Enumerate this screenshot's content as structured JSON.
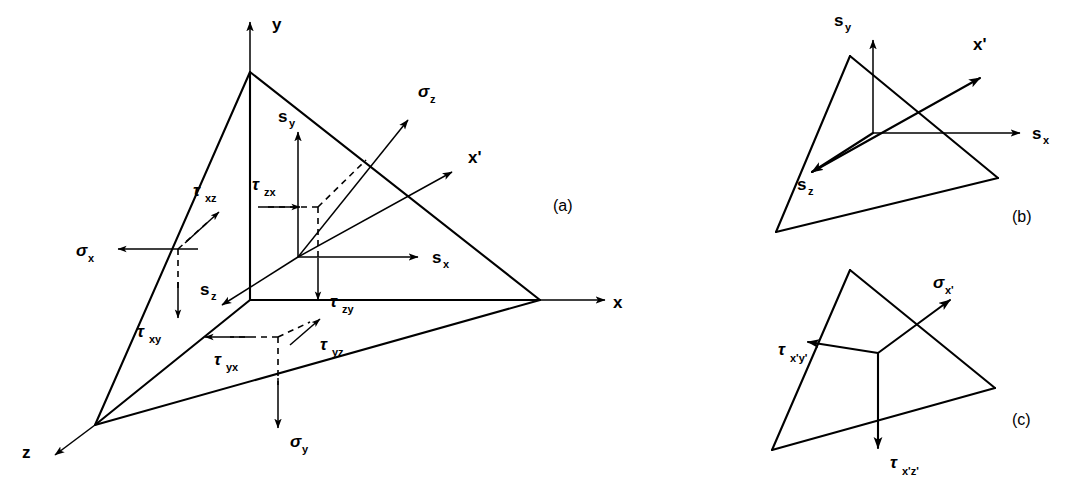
{
  "figure": {
    "background_color": "#ffffff",
    "ink_color": "#000000"
  },
  "panels": [
    {
      "id": "a",
      "tag": "(a)",
      "description": "Tetrahedron with coordinate axes and stress components on the three orthogonal faces"
    },
    {
      "id": "b",
      "tag": "(b)",
      "description": "Oblique plane with resultant traction components sx, sy, sz and normal x-prime"
    },
    {
      "id": "c",
      "tag": "(c)",
      "description": "Oblique plane with normal stress sigma x-prime and shear stresses tau x'y' and tau x'z'"
    }
  ],
  "panel_a": {
    "tag": "(a)",
    "axes": [
      {
        "name": "axis-y",
        "label": "y",
        "sub": ""
      },
      {
        "name": "axis-x",
        "label": "x",
        "sub": ""
      },
      {
        "name": "axis-z",
        "label": "z",
        "sub": ""
      }
    ],
    "labels": [
      {
        "name": "label-y-axis",
        "base": "y",
        "sub": ""
      },
      {
        "name": "label-x-axis",
        "base": "x",
        "sub": ""
      },
      {
        "name": "label-z-axis",
        "base": "z",
        "sub": ""
      },
      {
        "name": "label-x-prime",
        "base": "x'",
        "sub": ""
      },
      {
        "name": "label-sigma-z",
        "base": "σ",
        "sub": "z"
      },
      {
        "name": "label-sigma-x",
        "base": "σ",
        "sub": "x"
      },
      {
        "name": "label-sigma-y",
        "base": "σ",
        "sub": "y"
      },
      {
        "name": "label-s-x",
        "base": "s",
        "sub": "x"
      },
      {
        "name": "label-s-y",
        "base": "s",
        "sub": "y"
      },
      {
        "name": "label-s-z",
        "base": "s",
        "sub": "z"
      },
      {
        "name": "label-tau-zx",
        "base": "τ",
        "sub": "zx"
      },
      {
        "name": "label-tau-zy",
        "base": "τ",
        "sub": "zy"
      },
      {
        "name": "label-tau-xz",
        "base": "τ",
        "sub": "xz"
      },
      {
        "name": "label-tau-xy",
        "base": "τ",
        "sub": "xy"
      },
      {
        "name": "label-tau-yz",
        "base": "τ",
        "sub": "yz"
      },
      {
        "name": "label-tau-yx",
        "base": "τ",
        "sub": "yx"
      }
    ],
    "text": {
      "y": "y",
      "x": "x",
      "z": "z",
      "x_prime": "x'",
      "sigma": "σ",
      "tau": "τ",
      "s": "s",
      "sub_z": "z",
      "sub_x": "x",
      "sub_y": "y",
      "sub_zx": "zx",
      "sub_zy": "zy",
      "sub_xz": "xz",
      "sub_xy": "xy",
      "sub_yz": "yz",
      "sub_yx": "yx"
    }
  },
  "panel_b": {
    "tag": "(b)",
    "text": {
      "s": "s",
      "x_prime": "x'",
      "sub_x": "x",
      "sub_y": "y",
      "sub_z": "z"
    },
    "labels": [
      {
        "name": "label-s-y",
        "base": "s",
        "sub": "y"
      },
      {
        "name": "label-s-x",
        "base": "s",
        "sub": "x"
      },
      {
        "name": "label-s-z",
        "base": "s",
        "sub": "z"
      },
      {
        "name": "label-x-prime",
        "base": "x'",
        "sub": ""
      }
    ]
  },
  "panel_c": {
    "tag": "(c)",
    "text": {
      "sigma": "σ",
      "tau": "τ",
      "sub_x_prime": "x'",
      "sub_x_prime_y_prime": "x'y'",
      "sub_x_prime_z_prime": "x'z'"
    },
    "labels": [
      {
        "name": "label-sigma-x-prime",
        "base": "σ",
        "sub": "x'"
      },
      {
        "name": "label-tau-x-prime-y-prime",
        "base": "τ",
        "sub": "x'y'"
      },
      {
        "name": "label-tau-x-prime-z-prime",
        "base": "τ",
        "sub": "x'z'"
      }
    ]
  }
}
